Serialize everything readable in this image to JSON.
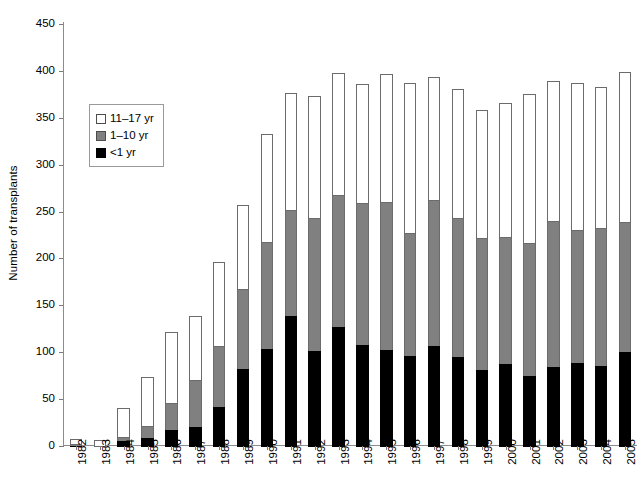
{
  "chart_data": {
    "type": "bar",
    "stacked": true,
    "title": "",
    "xlabel": "",
    "ylabel": "Number of transplants",
    "ylim": [
      0,
      450
    ],
    "ytick_step": 50,
    "yticks": [
      0,
      50,
      100,
      150,
      200,
      250,
      300,
      350,
      400,
      450
    ],
    "grid": false,
    "legend_position": "inside-upper-left",
    "categories": [
      "1982",
      "1983",
      "1984",
      "1985",
      "1986",
      "1987",
      "1988",
      "1989",
      "1990",
      "1991",
      "1992",
      "1993",
      "1994",
      "1995",
      "1996",
      "1997",
      "1998",
      "1999",
      "2000",
      "2001",
      "2002",
      "2003",
      "2004",
      "2005"
    ],
    "series": [
      {
        "name": "<1 yr",
        "color": "#000000",
        "values": [
          1,
          0,
          6,
          10,
          18,
          21,
          43,
          83,
          104,
          140,
          102,
          128,
          109,
          103,
          97,
          108,
          96,
          82,
          89,
          76,
          85,
          90,
          86,
          101
        ]
      },
      {
        "name": "1-10 yr",
        "color": "#808080",
        "values": [
          3,
          1,
          6,
          13,
          30,
          52,
          66,
          87,
          116,
          114,
          143,
          142,
          152,
          159,
          132,
          156,
          149,
          142,
          136,
          143,
          157,
          143,
          149,
          140
        ]
      },
      {
        "name": "11-17 yr",
        "color": "#ffffff",
        "values": [
          6,
          7,
          32,
          54,
          77,
          69,
          90,
          90,
          116,
          126,
          131,
          131,
          128,
          138,
          161,
          133,
          139,
          138,
          144,
          160,
          150,
          157,
          151,
          161
        ]
      }
    ],
    "totals": [
      10,
      8,
      44,
      77,
      125,
      142,
      199,
      260,
      336,
      380,
      376,
      401,
      389,
      400,
      390,
      397,
      384,
      362,
      369,
      379,
      392,
      390,
      386,
      402
    ]
  },
  "legend": {
    "items": [
      {
        "label": "11–17 yr",
        "swatch": "white"
      },
      {
        "label": "1–10 yr",
        "swatch": "gray"
      },
      {
        "label": "<1 yr",
        "swatch": "black"
      }
    ]
  },
  "axes": {
    "y_title": "Number of transplants"
  }
}
